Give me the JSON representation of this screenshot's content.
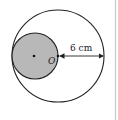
{
  "diagram": {
    "outer_circle": {
      "cx": 58,
      "cy": 56,
      "r": 46
    },
    "inner_circle": {
      "cx": 35,
      "cy": 56,
      "r": 23,
      "fill": "#b8b8b8"
    },
    "center_label": "O",
    "dimension_label": "6 cm",
    "stroke_color": "#222222",
    "right_border_color": "#c8c8c8"
  }
}
